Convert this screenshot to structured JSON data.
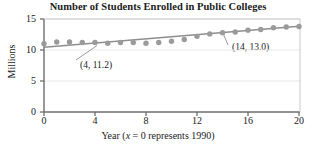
{
  "chart_data": {
    "type": "scatter",
    "title": "Number of Students Enrolled in Public Colleges",
    "xlabel": "Year (x = 0 represents 1990)",
    "xlabel_parts": {
      "prefix": "Year (",
      "italic": "x",
      "suffix": " = 0 represents 1990)"
    },
    "ylabel": "Millions",
    "xlim": [
      0,
      20
    ],
    "ylim": [
      0,
      15
    ],
    "xticks": [
      0,
      4,
      8,
      12,
      16,
      20
    ],
    "xtick_labels": [
      "0",
      "4",
      "8",
      "12",
      "16",
      "20"
    ],
    "yticks": [
      0,
      5,
      10,
      15
    ],
    "ytick_labels": [
      "0",
      "5",
      "10",
      "15"
    ],
    "grid": true,
    "legend": null,
    "marker_color": "#9a9a9a",
    "line_color": "#8e8e8e",
    "axis_color": "#6e6e6e",
    "grid_color": "#e8e8e8",
    "x": [
      0,
      1,
      2,
      3,
      4,
      5,
      6,
      7,
      8,
      9,
      10,
      11,
      12,
      13,
      14,
      15,
      16,
      17,
      18,
      19,
      20
    ],
    "values": [
      11.0,
      11.3,
      11.3,
      11.2,
      11.2,
      11.1,
      11.2,
      11.2,
      11.1,
      11.2,
      11.4,
      11.7,
      12.2,
      12.6,
      12.8,
      12.9,
      13.2,
      13.3,
      13.6,
      13.7,
      13.8
    ],
    "series": [
      {
        "name": "Students enrolled (millions)",
        "values": [
          11.0,
          11.3,
          11.3,
          11.2,
          11.2,
          11.1,
          11.2,
          11.2,
          11.1,
          11.2,
          11.4,
          11.7,
          12.2,
          12.6,
          12.8,
          12.9,
          13.2,
          13.3,
          13.6,
          13.7,
          13.8
        ]
      }
    ],
    "trend_line": {
      "type": "line",
      "points": [
        [
          0,
          10.45
        ],
        [
          20,
          13.85
        ]
      ],
      "through": [
        [
          4,
          11.2
        ],
        [
          14,
          13.0
        ]
      ]
    },
    "annotations": [
      {
        "label": "(4, 11.2)",
        "x": 4,
        "y": 11.2,
        "text_x": 80,
        "text_y": 66
      },
      {
        "label": "(14, 13.0)",
        "x": 14,
        "y": 13.0,
        "text_x": 232,
        "text_y": 48
      }
    ]
  }
}
